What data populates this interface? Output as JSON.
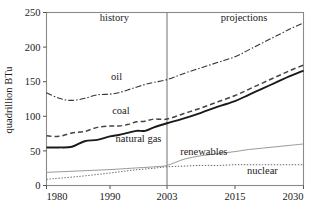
{
  "chart_data": {
    "type": "line",
    "title": "",
    "xlabel": "",
    "ylabel": "quadrillion BTu",
    "xlim": [
      1980,
      2030
    ],
    "ylim": [
      0,
      250
    ],
    "grid": false,
    "legend_position": "inline-annotations",
    "xticks": [
      1980,
      1990,
      2003,
      2015,
      2030
    ],
    "xtick_labels": [
      "1980",
      "1990",
      "2003",
      "2015",
      "2030"
    ],
    "yticks": [
      0,
      50,
      100,
      150,
      200,
      250
    ],
    "ytick_labels": [
      "0",
      "50",
      "100",
      "150",
      "200",
      "250"
    ],
    "annotations": [
      {
        "text": "history",
        "x": 1991,
        "y": 237
      },
      {
        "text": "projections",
        "x": 2017,
        "y": 237
      },
      {
        "text": "oil",
        "x": 1991.5,
        "y": 152
      },
      {
        "text": "coal",
        "x": 1992.5,
        "y": 103
      },
      {
        "text": "natural gas",
        "x": 1996.5,
        "y": 63
      },
      {
        "text": "renewables",
        "x": 2009.5,
        "y": 44
      },
      {
        "text": "nuclear",
        "x": 2021,
        "y": 17
      }
    ],
    "divider_x": 2003,
    "divider_label": "history/projections boundary",
    "series": [
      {
        "name": "oil",
        "style": "dash-dot",
        "color": "#333333",
        "x": [
          1980,
          1982,
          1984,
          1986,
          1988,
          1990,
          1992,
          1994,
          1996,
          1998,
          2000,
          2003,
          2006,
          2009,
          2012,
          2015,
          2018,
          2021,
          2024,
          2027,
          2030
        ],
        "values": [
          134,
          126,
          123,
          126,
          131,
          132,
          134,
          138,
          142,
          146,
          149,
          153,
          162,
          170,
          178,
          186,
          196,
          206,
          216,
          226,
          235
        ]
      },
      {
        "name": "coal",
        "style": "dashed",
        "color": "#444444",
        "x": [
          1980,
          1982,
          1984,
          1986,
          1988,
          1990,
          1992,
          1994,
          1996,
          1998,
          2000,
          2003,
          2006,
          2009,
          2012,
          2015,
          2018,
          2021,
          2024,
          2027,
          2030
        ],
        "values": [
          72,
          71,
          76,
          78,
          84,
          86,
          86,
          88,
          92,
          93,
          96,
          96,
          104,
          112,
          121,
          130,
          139,
          148,
          157,
          166,
          174
        ]
      },
      {
        "name": "natural gas",
        "style": "solid-thick",
        "color": "#1a1a1a",
        "x": [
          1980,
          1982,
          1984,
          1986,
          1988,
          1990,
          1992,
          1994,
          1996,
          1998,
          2000,
          2003,
          2006,
          2009,
          2012,
          2015,
          2018,
          2021,
          2024,
          2027,
          2030
        ],
        "values": [
          55,
          55,
          56,
          64,
          66,
          71,
          73,
          76,
          79,
          79,
          84,
          90,
          97,
          105,
          114,
          122,
          131,
          140,
          149,
          158,
          166
        ]
      },
      {
        "name": "renewables",
        "style": "thin-solid",
        "color": "#999999",
        "x": [
          1980,
          1985,
          1990,
          1995,
          2000,
          2003,
          2006,
          2009,
          2012,
          2015,
          2018,
          2021,
          2024,
          2027,
          2030
        ],
        "values": [
          19,
          21,
          23,
          25,
          27,
          29,
          38,
          43,
          46,
          49,
          52,
          54,
          56,
          58,
          60
        ]
      },
      {
        "name": "nuclear",
        "style": "dotted",
        "color": "#666666",
        "x": [
          1980,
          1985,
          1990,
          1995,
          2000,
          2003,
          2006,
          2009,
          2012,
          2015,
          2018,
          2021,
          2024,
          2027,
          2030
        ],
        "values": [
          9,
          13,
          18,
          22,
          25,
          27,
          28,
          29,
          29,
          30,
          30,
          30,
          30,
          30,
          30
        ]
      }
    ]
  }
}
